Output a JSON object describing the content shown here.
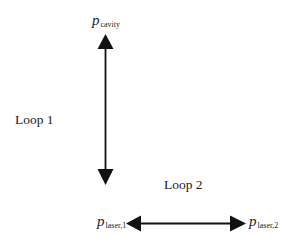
{
  "diagram": {
    "nodes": {
      "cavity": {
        "symbol": "p",
        "subscript": "cavity"
      },
      "laser1": {
        "symbol": "p",
        "subscript": "laser,1"
      },
      "laser2": {
        "symbol": "p",
        "subscript": "laser,2"
      }
    },
    "loops": {
      "loop1": {
        "label": "Loop 1"
      },
      "loop2": {
        "label": "Loop 2"
      }
    },
    "edges": [
      {
        "from": "cavity",
        "to": "bottom",
        "direction": "bidirectional",
        "orientation": "vertical",
        "loop": "Loop 1"
      },
      {
        "from": "laser1",
        "to": "laser2",
        "direction": "bidirectional",
        "orientation": "horizontal",
        "loop": "Loop 2"
      }
    ],
    "colors": {
      "arrow": "#111111",
      "text": "#222222",
      "background": "#ffffff"
    }
  }
}
